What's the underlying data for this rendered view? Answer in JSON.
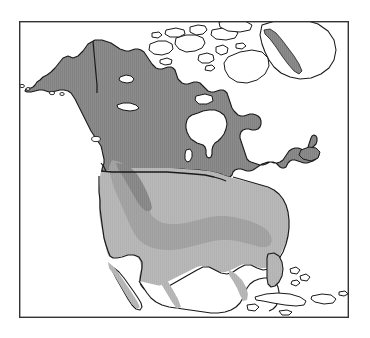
{
  "figure": {
    "kind": "range-distribution-map",
    "region": "North America",
    "title": "",
    "caption": "",
    "background_color": "#ffffff",
    "frame": {
      "stroke": "#333333",
      "stroke_width": 1.4,
      "x": 19,
      "y": 21,
      "width": 330,
      "height": 297
    }
  },
  "legend": {
    "visible": false,
    "entries": [
      {
        "label": "",
        "swatch_color": "#8c8c8c",
        "name": "dark-range-zone"
      },
      {
        "label": "",
        "swatch_color": "#b9b9b9",
        "name": "light-range-zone"
      },
      {
        "label": "",
        "swatch_color": "#a8a8a8",
        "name": "mid-range-zone"
      },
      {
        "label": "",
        "swatch_color": "#ffffff",
        "name": "unshaded-zone"
      }
    ]
  },
  "colors": {
    "dark_gray": "#8c8c8c",
    "mid_gray": "#a6a6a6",
    "light_gray": "#b9b9b9",
    "coast_stroke": "#1a1a1a",
    "border_stroke": "#1a1a1a",
    "frame_stroke": "#333333",
    "water": "#ffffff",
    "land_unshaded": "#ffffff"
  },
  "features": {
    "shaded_regions": [
      {
        "name": "canada-alaska-dark-zone",
        "tone": "dark_gray"
      },
      {
        "name": "conterminous-us-light-zone",
        "tone": "light_gray"
      },
      {
        "name": "central-plains-mid-zone",
        "tone": "mid_gray"
      },
      {
        "name": "greenland-west-coast-strip",
        "tone": "dark_gray"
      },
      {
        "name": "mexico-coastal-strips",
        "tone": "light_gray"
      }
    ],
    "unshaded_regions": [
      {
        "name": "canadian-arctic-archipelago"
      },
      {
        "name": "hudson-bay"
      },
      {
        "name": "great-lakes"
      },
      {
        "name": "greenland-interior"
      },
      {
        "name": "cuba"
      },
      {
        "name": "bahamas"
      },
      {
        "name": "baja-california-interior"
      },
      {
        "name": "mexico-interior"
      }
    ],
    "boundaries": [
      {
        "name": "us-canada-border-49th-parallel"
      },
      {
        "name": "alaska-yukon-border"
      }
    ]
  },
  "map_data": {
    "type": "choropleth",
    "projection": "lambert-conformal-conic",
    "extent_description": "North America from Alaska and Arctic Canada south to Mexico and the Caribbean",
    "classes": [
      {
        "id": "dark",
        "fill": "#8c8c8c",
        "coverage": "Alaska, Yukon, all of mainland Canada, northern Great Lakes fringe, Labrador, Newfoundland, western Greenland coastal strip"
      },
      {
        "id": "mid",
        "fill": "#a6a6a6",
        "coverage": "Central and southern Great Plains band through the conterminous United States"
      },
      {
        "id": "light",
        "fill": "#b9b9b9",
        "coverage": "Conterminous United States including Florida, extending into northern Mexico and Baja California"
      },
      {
        "id": "none",
        "fill": "#ffffff",
        "coverage": "Canadian Arctic Archipelago, Hudson Bay, Great Lakes, interior Greenland, Cuba, Bahamas, southern Mexico"
      }
    ]
  }
}
